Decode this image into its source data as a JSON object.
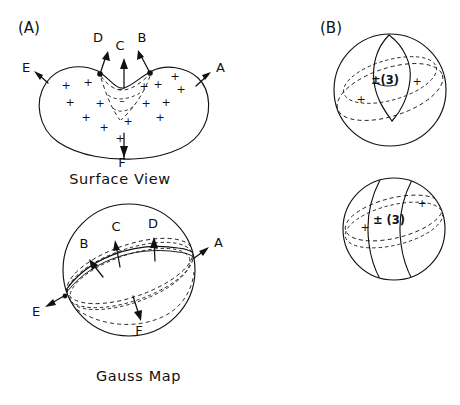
{
  "figure": {
    "background_color": "#ffffff",
    "ink_color": "#111111",
    "width": 460,
    "height": 405
  },
  "panels": [
    {
      "id": "A",
      "label": "(A)",
      "label_x": 18,
      "label_y": 33,
      "subfigures": [
        {
          "id": "surface-view",
          "caption": "Surface View",
          "caption_x": 120,
          "caption_y": 184,
          "vectors": [
            {
              "name": "A",
              "label": "A",
              "label_x": 216,
              "label_y": 72
            },
            {
              "name": "B",
              "label": "B",
              "label_x": 142,
              "label_y": 42
            },
            {
              "name": "C",
              "label": "C",
              "label_x": 120,
              "label_y": 50
            },
            {
              "name": "D",
              "label": "D",
              "label_x": 98,
              "label_y": 42
            },
            {
              "name": "E",
              "label": "E",
              "label_x": 26,
              "label_y": 72
            },
            {
              "name": "F",
              "label": "F",
              "label_x": 122,
              "label_y": 167
            }
          ],
          "positive_marks": [
            {
              "x": 66,
              "y": 89
            },
            {
              "x": 88,
              "y": 86
            },
            {
              "x": 70,
              "y": 106
            },
            {
              "x": 100,
              "y": 107
            },
            {
              "x": 86,
              "y": 121
            },
            {
              "x": 104,
              "y": 131
            },
            {
              "x": 128,
              "y": 125
            },
            {
              "x": 146,
              "y": 107
            },
            {
              "x": 144,
              "y": 90
            },
            {
              "x": 160,
              "y": 121
            },
            {
              "x": 166,
              "y": 106
            },
            {
              "x": 175,
              "y": 80
            },
            {
              "x": 181,
              "y": 93
            },
            {
              "x": 158,
              "y": 88
            },
            {
              "x": 120,
              "y": 142
            }
          ],
          "negative_marks": [
            {
              "x": 120,
              "y": 92
            },
            {
              "x": 122,
              "y": 104
            }
          ]
        },
        {
          "id": "gauss-map",
          "caption": "Gauss Map",
          "caption_x": 96,
          "caption_y": 381,
          "vectors": [
            {
              "name": "A",
              "label": "A",
              "label_x": 214,
              "label_y": 247
            },
            {
              "name": "B",
              "label": "B",
              "label_x": 84,
              "label_y": 248
            },
            {
              "name": "C",
              "label": "C",
              "label_x": 116,
              "label_y": 231
            },
            {
              "name": "D",
              "label": "D",
              "label_x": 153,
              "label_y": 228
            },
            {
              "name": "E",
              "label": "E",
              "label_x": 36,
              "label_y": 316
            },
            {
              "name": "F",
              "label": "F",
              "label_x": 139,
              "label_y": 335
            }
          ]
        }
      ]
    },
    {
      "id": "B",
      "label": "(B)",
      "label_x": 320,
      "label_y": 33,
      "subfigures": [
        {
          "id": "sphere-top",
          "region_label": "±(3)",
          "region_label_x": 385,
          "region_label_y": 84,
          "positive_marks": [
            {
              "x": 417,
              "y": 85
            },
            {
              "x": 361,
              "y": 103
            }
          ]
        },
        {
          "id": "sphere-bottom",
          "region_label": "± (3)",
          "region_label_x": 389,
          "region_label_y": 224,
          "positive_marks": [
            {
              "x": 422,
              "y": 207
            },
            {
              "x": 365,
              "y": 231
            }
          ]
        }
      ]
    }
  ],
  "glyphs": {
    "plus": "+",
    "minus": "–"
  }
}
